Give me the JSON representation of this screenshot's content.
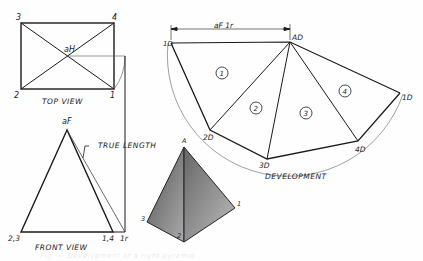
{
  "top_view": {
    "caption": "TOP VIEW",
    "corners": {
      "c3": "3",
      "c4": "4",
      "c2": "2",
      "c1": "1"
    },
    "apex": "aH"
  },
  "front_view": {
    "caption": "FRONT VIEW",
    "apex": "aF",
    "base_left": "2,3",
    "base_right": "1,4",
    "revolved_point": "1r",
    "annotation": "TRUE LENGTH"
  },
  "pictorial": {
    "apex": "A",
    "corners": {
      "left": "3",
      "front": "2",
      "right": "1"
    }
  },
  "development": {
    "caption": "DEVELOPMENT",
    "dimension": "aF 1r",
    "points": {
      "start": "1D",
      "apex": "AD",
      "p2": "2D",
      "p3": "3D",
      "p4": "4D",
      "end": "1D"
    },
    "faces": [
      "1",
      "2",
      "3",
      "4"
    ]
  },
  "footer": {
    "faint_caption": "Fig. — Development of a right pyramid"
  }
}
